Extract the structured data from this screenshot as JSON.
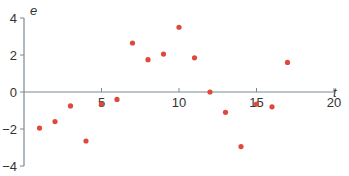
{
  "chart_data": {
    "type": "scatter",
    "title": "",
    "xlabel": "t",
    "ylabel": "e",
    "xlim": [
      0,
      20
    ],
    "ylim": [
      -4,
      4
    ],
    "xticks": [
      5,
      10,
      15,
      20
    ],
    "xtick_labels": [
      "5",
      "10",
      "15",
      "20"
    ],
    "yticks": [
      4,
      2,
      0,
      -2,
      -4
    ],
    "ytick_labels": [
      "4",
      "2",
      "0",
      "−2",
      "−4"
    ],
    "grid": false,
    "legend": null,
    "marker_color": "#e0483a",
    "axis_color": "#7a8a94",
    "series": [
      {
        "name": "residuals",
        "x": [
          1,
          2,
          3,
          4,
          5,
          6,
          7,
          8,
          9,
          10,
          11,
          12,
          13,
          14,
          15,
          16,
          17
        ],
        "y": [
          -1.95,
          -1.6,
          -0.75,
          -2.65,
          -0.65,
          -0.4,
          2.65,
          1.75,
          2.05,
          3.5,
          1.85,
          0.0,
          -1.1,
          -2.95,
          -0.65,
          -0.8,
          1.6
        ]
      }
    ]
  }
}
